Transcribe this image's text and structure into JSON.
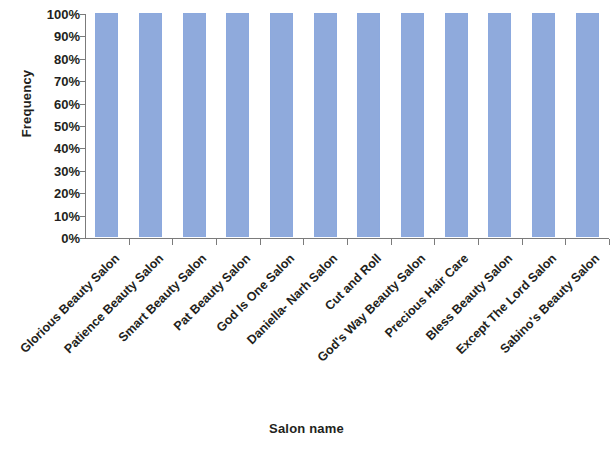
{
  "chart_data": {
    "type": "bar",
    "title": "",
    "xlabel": "Salon name",
    "ylabel": "Frequency",
    "categories": [
      "Glorious Beauty Salon",
      "Patience Beauty Salon",
      "Smart Beauty Salon",
      "Pat Beauty Salon",
      "God Is One Salon",
      "Daniella- Narh Salon",
      "Cut and Roll",
      "God's Way Beauty Salon",
      "Precious Hair Care",
      "Bless Beauty Salon",
      "Except The Lord Salon",
      "Sabino's Beauty Salon"
    ],
    "values": [
      100,
      100,
      100,
      100,
      100,
      100,
      100,
      100,
      100,
      100,
      100,
      100
    ],
    "ytick_labels": [
      "100%",
      "90%",
      "80%",
      "70%",
      "60%",
      "50%",
      "40%",
      "30%",
      "20%",
      "10%",
      "0%"
    ],
    "ytick_values": [
      100,
      90,
      80,
      70,
      60,
      50,
      40,
      30,
      20,
      10,
      0
    ],
    "ylim": [
      0,
      100
    ],
    "grid": false,
    "legend": false,
    "legend_position": "none",
    "bar_color": "#8faadc",
    "axis_color": "#7b7b7b",
    "text_color": "#231f20",
    "background_color": "#ffffff",
    "value_suffix": "%",
    "category_label_rotation_deg": -45
  }
}
